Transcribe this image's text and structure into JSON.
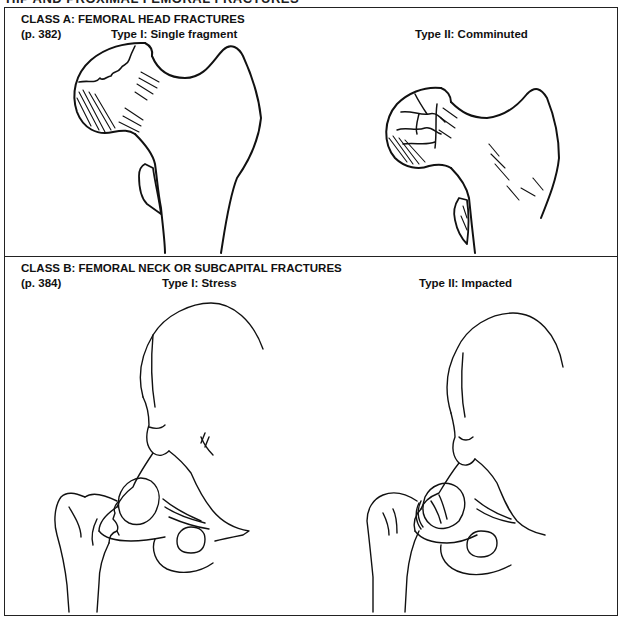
{
  "page": {
    "cut_heading": "HIP AND PROXIMAL FEMORAL FRACTURES"
  },
  "class_a": {
    "title": "CLASS A: FEMORAL HEAD FRACTURES",
    "page_ref": "(p. 382)",
    "types": [
      {
        "label": "Type I: Single fragment",
        "illustration": "femur-head-single-fragment"
      },
      {
        "label": "Type II: Comminuted",
        "illustration": "femur-head-comminuted"
      }
    ]
  },
  "class_b": {
    "title": "CLASS B: FEMORAL NECK OR SUBCAPITAL FRACTURES",
    "page_ref": "(p. 384)",
    "types": [
      {
        "label": "Type I: Stress",
        "illustration": "hip-joint-stress-fracture"
      },
      {
        "label": "Type II: Impacted",
        "illustration": "hip-joint-impacted-fracture"
      }
    ]
  }
}
